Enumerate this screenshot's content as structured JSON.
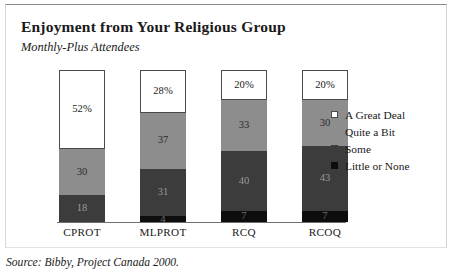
{
  "figure": {
    "title": "Enjoyment from Your Religious Group",
    "subtitle": "Monthly-Plus Attendees",
    "source": "Source: Bibby, Project Canada 2000."
  },
  "legend": {
    "items": [
      {
        "label": "A Great Deal",
        "swatch": "legend-swatch-great-deal",
        "color": "#ffffff"
      },
      {
        "label": "Quite a Bit",
        "swatch": "legend-swatch-quite-a-bit",
        "color": "#8d8d8d"
      },
      {
        "label": "Some",
        "swatch": "legend-swatch-some",
        "color": "#3c3c3c"
      },
      {
        "label": "Little or None",
        "swatch": "legend-swatch-little-none",
        "color": "#0d0d0d"
      }
    ]
  },
  "bars": [
    {
      "category": "CPROT",
      "segments": [
        {
          "series": "A Great Deal",
          "label": "52%",
          "value": 52
        },
        {
          "series": "Quite a Bit",
          "label": "30",
          "value": 30
        },
        {
          "series": "Some",
          "label": "18",
          "value": 18
        },
        {
          "series": "Little or None",
          "label": "",
          "value": 0
        }
      ]
    },
    {
      "category": "MLPROT",
      "segments": [
        {
          "series": "A Great Deal",
          "label": "28%",
          "value": 28
        },
        {
          "series": "Quite a Bit",
          "label": "37",
          "value": 37
        },
        {
          "series": "Some",
          "label": "31",
          "value": 31
        },
        {
          "series": "Little or None",
          "label": "4",
          "value": 4
        }
      ]
    },
    {
      "category": "RCQ",
      "segments": [
        {
          "series": "A Great Deal",
          "label": "20%",
          "value": 20
        },
        {
          "series": "Quite a Bit",
          "label": "33",
          "value": 33
        },
        {
          "series": "Some",
          "label": "40",
          "value": 40
        },
        {
          "series": "Little or None",
          "label": "7",
          "value": 7
        }
      ]
    },
    {
      "category": "RCOQ",
      "segments": [
        {
          "series": "A Great Deal",
          "label": "20%",
          "value": 20
        },
        {
          "series": "Quite a Bit",
          "label": "30",
          "value": 30
        },
        {
          "series": "Some",
          "label": "43",
          "value": 43
        },
        {
          "series": "Little or None",
          "label": "7",
          "value": 7
        }
      ]
    }
  ],
  "chart_data": {
    "type": "bar",
    "subtype": "stacked-100-percent",
    "title": "Enjoyment from Your Religious Group",
    "subtitle": "Monthly-Plus Attendees",
    "xlabel": "",
    "ylabel": "",
    "ylim": [
      0,
      100
    ],
    "grid": false,
    "legend_position": "right",
    "categories": [
      "CPROT",
      "MLPROT",
      "RCQ",
      "RCOQ"
    ],
    "series": [
      {
        "name": "A Great Deal",
        "values": [
          52,
          28,
          20,
          20
        ],
        "color": "#ffffff"
      },
      {
        "name": "Quite a Bit",
        "values": [
          30,
          37,
          33,
          30
        ],
        "color": "#8d8d8d"
      },
      {
        "name": "Some",
        "values": [
          18,
          31,
          40,
          43
        ],
        "color": "#3c3c3c"
      },
      {
        "name": "Little or None",
        "values": [
          0,
          4,
          7,
          7
        ],
        "color": "#0d0d0d"
      }
    ],
    "data_labels": [
      [
        "52%",
        "30",
        "18",
        ""
      ],
      [
        "28%",
        "37",
        "31",
        "4"
      ],
      [
        "20%",
        "33",
        "40",
        "7"
      ],
      [
        "20%",
        "30",
        "43",
        "7"
      ]
    ],
    "annotations": [
      "Source: Bibby, Project Canada 2000."
    ]
  }
}
